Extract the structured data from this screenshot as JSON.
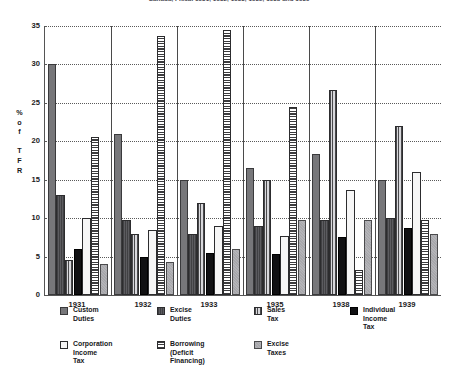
{
  "chart_data": {
    "type": "bar",
    "title": "Canada, Fiscal 1931, 1932, 1933, 1935, 1938 and 1939",
    "xlabel": "",
    "ylabel": "% of TFR",
    "ylabel_stacked": [
      "%",
      "o",
      "f",
      "",
      "T",
      "F",
      "R"
    ],
    "ylim": [
      0,
      35
    ],
    "yticks": [
      0,
      5,
      10,
      15,
      20,
      25,
      30,
      35
    ],
    "grid": true,
    "legend_position": "bottom",
    "categories": [
      "1931",
      "1932",
      "1933",
      "1935",
      "1938",
      "1939"
    ],
    "series": [
      {
        "name": "Custom Duties",
        "pattern": "solid-gray",
        "values": [
          30.0,
          21.0,
          15.0,
          16.5,
          18.3,
          15.0
        ]
      },
      {
        "name": "Excise Duties",
        "pattern": "dark-dense",
        "values": [
          13.0,
          9.8,
          8.0,
          9.0,
          9.8,
          10.0
        ]
      },
      {
        "name": "Sales Tax",
        "pattern": "vertical-hatch",
        "values": [
          4.5,
          8.0,
          12.0,
          15.0,
          26.7,
          22.0
        ]
      },
      {
        "name": "Individual Income Tax",
        "pattern": "solid-black",
        "values": [
          6.0,
          5.0,
          5.5,
          5.3,
          7.5,
          8.7
        ]
      },
      {
        "name": "Corporation Income Tax",
        "pattern": "white-outline",
        "values": [
          10.0,
          8.5,
          9.0,
          7.7,
          13.7,
          16.0
        ]
      },
      {
        "name": "Borrowing (Deficit Financing)",
        "pattern": "horizontal-hatch",
        "values": [
          20.5,
          33.7,
          34.5,
          24.5,
          3.3,
          9.7
        ]
      },
      {
        "name": "Excise Taxes",
        "pattern": "light-gray",
        "values": [
          4.0,
          4.3,
          6.0,
          9.7,
          9.7,
          8.0
        ]
      }
    ],
    "legend_rows": [
      [
        "Custom Duties",
        "Excise Duties",
        "Sales Tax",
        "Individual Income\nTax"
      ],
      [
        "Corporation Income\nTax",
        "Borrowing (Deficit\nFinancing)",
        "Excise Taxes"
      ]
    ],
    "colors": {
      "custom_duties": "#77777a",
      "excise_duties": "#5c5c60",
      "sales_tax": "#9a9a9e",
      "individual_income_tax": "#111113",
      "corporation_income_tax": "#f6f6f6",
      "borrowing": "#8a8a8e",
      "excise_taxes": "#b4b4b8",
      "axis": "#1b1b1b",
      "grid": "#5a5a5a",
      "background": "#ffffff"
    }
  }
}
